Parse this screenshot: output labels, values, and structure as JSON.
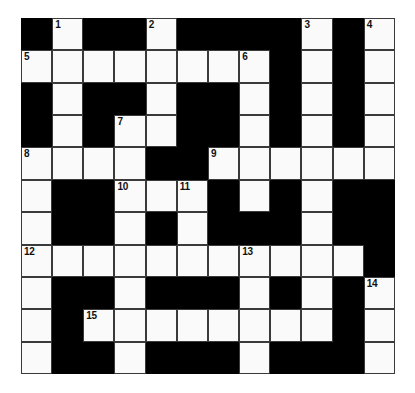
{
  "puzzle": {
    "title": "Crossword Grid",
    "rows": 11,
    "columns": 12,
    "colors": {
      "block": "#000000",
      "open": "#fafafa",
      "border": "#3a3a3a",
      "number_text": "#111111",
      "page_background": "#ffffff"
    },
    "clue_numbers": [
      1,
      2,
      3,
      4,
      5,
      6,
      7,
      8,
      9,
      10,
      11,
      12,
      13,
      14,
      15
    ],
    "grid": [
      [
        {
          "type": "block"
        },
        {
          "type": "open",
          "number": "1"
        },
        {
          "type": "block"
        },
        {
          "type": "block"
        },
        {
          "type": "open",
          "number": "2"
        },
        {
          "type": "block"
        },
        {
          "type": "block"
        },
        {
          "type": "block"
        },
        {
          "type": "block"
        },
        {
          "type": "open",
          "number": "3"
        },
        {
          "type": "block"
        },
        {
          "type": "open",
          "number": "4"
        }
      ],
      [
        {
          "type": "open",
          "number": "5"
        },
        {
          "type": "open"
        },
        {
          "type": "open"
        },
        {
          "type": "open"
        },
        {
          "type": "open"
        },
        {
          "type": "open"
        },
        {
          "type": "open"
        },
        {
          "type": "open",
          "number": "6"
        },
        {
          "type": "block"
        },
        {
          "type": "open"
        },
        {
          "type": "block"
        },
        {
          "type": "open"
        }
      ],
      [
        {
          "type": "block"
        },
        {
          "type": "open"
        },
        {
          "type": "block"
        },
        {
          "type": "block"
        },
        {
          "type": "open"
        },
        {
          "type": "block"
        },
        {
          "type": "block"
        },
        {
          "type": "open"
        },
        {
          "type": "block"
        },
        {
          "type": "open"
        },
        {
          "type": "block"
        },
        {
          "type": "open"
        }
      ],
      [
        {
          "type": "block"
        },
        {
          "type": "open"
        },
        {
          "type": "block"
        },
        {
          "type": "open",
          "number": "7"
        },
        {
          "type": "open"
        },
        {
          "type": "block"
        },
        {
          "type": "block"
        },
        {
          "type": "open"
        },
        {
          "type": "block"
        },
        {
          "type": "open"
        },
        {
          "type": "block"
        },
        {
          "type": "open"
        }
      ],
      [
        {
          "type": "open",
          "number": "8"
        },
        {
          "type": "open"
        },
        {
          "type": "open"
        },
        {
          "type": "open"
        },
        {
          "type": "block"
        },
        {
          "type": "block"
        },
        {
          "type": "open",
          "number": "9"
        },
        {
          "type": "open"
        },
        {
          "type": "open"
        },
        {
          "type": "open"
        },
        {
          "type": "open"
        },
        {
          "type": "open"
        }
      ],
      [
        {
          "type": "open"
        },
        {
          "type": "block"
        },
        {
          "type": "block"
        },
        {
          "type": "open",
          "number": "10"
        },
        {
          "type": "open"
        },
        {
          "type": "open",
          "number": "11"
        },
        {
          "type": "block"
        },
        {
          "type": "open"
        },
        {
          "type": "block"
        },
        {
          "type": "open"
        },
        {
          "type": "block"
        },
        {
          "type": "block"
        }
      ],
      [
        {
          "type": "open"
        },
        {
          "type": "block"
        },
        {
          "type": "block"
        },
        {
          "type": "open"
        },
        {
          "type": "block"
        },
        {
          "type": "open"
        },
        {
          "type": "block"
        },
        {
          "type": "block"
        },
        {
          "type": "block"
        },
        {
          "type": "open"
        },
        {
          "type": "block"
        },
        {
          "type": "block"
        }
      ],
      [
        {
          "type": "open",
          "number": "12"
        },
        {
          "type": "open"
        },
        {
          "type": "open"
        },
        {
          "type": "open"
        },
        {
          "type": "open"
        },
        {
          "type": "open"
        },
        {
          "type": "open"
        },
        {
          "type": "open",
          "number": "13"
        },
        {
          "type": "open"
        },
        {
          "type": "open"
        },
        {
          "type": "open"
        },
        {
          "type": "block"
        }
      ],
      [
        {
          "type": "open"
        },
        {
          "type": "block"
        },
        {
          "type": "block"
        },
        {
          "type": "open"
        },
        {
          "type": "block"
        },
        {
          "type": "block"
        },
        {
          "type": "block"
        },
        {
          "type": "open"
        },
        {
          "type": "block"
        },
        {
          "type": "open"
        },
        {
          "type": "block"
        },
        {
          "type": "open",
          "number": "14"
        }
      ],
      [
        {
          "type": "open"
        },
        {
          "type": "block"
        },
        {
          "type": "open",
          "number": "15"
        },
        {
          "type": "open"
        },
        {
          "type": "open"
        },
        {
          "type": "open"
        },
        {
          "type": "open"
        },
        {
          "type": "open"
        },
        {
          "type": "open"
        },
        {
          "type": "open"
        },
        {
          "type": "block"
        },
        {
          "type": "open"
        }
      ],
      [
        {
          "type": "open"
        },
        {
          "type": "block"
        },
        {
          "type": "block"
        },
        {
          "type": "open"
        },
        {
          "type": "block"
        },
        {
          "type": "block"
        },
        {
          "type": "block"
        },
        {
          "type": "open"
        },
        {
          "type": "block"
        },
        {
          "type": "block"
        },
        {
          "type": "block"
        },
        {
          "type": "open"
        }
      ]
    ]
  }
}
